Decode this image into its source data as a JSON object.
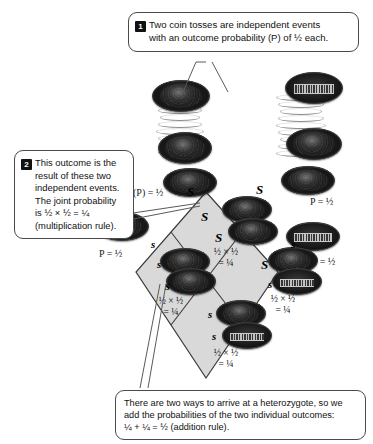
{
  "callouts": [
    {
      "id": "callout-1",
      "number": "1",
      "line1": "Two coin tosses are independent events",
      "line2": "with an outcome probability (P) of ½ each."
    },
    {
      "id": "callout-2",
      "number": "2",
      "line1": "This outcome is the",
      "line2": "result of these two",
      "line3": "independent events.",
      "line4": "The joint probability",
      "line5": "is ½ × ½ = ¼",
      "line6": "(multiplication rule)."
    },
    {
      "id": "callout-3",
      "line1": "There are two ways to arrive at a heterozygote, so we",
      "line2": "add the probabilities of the two individual outcomes:",
      "line3": "¼ + ¼ = ½  (addition rule)."
    }
  ],
  "probability_labels": [
    {
      "name": "p-label-top-left",
      "text": "(P) = ½"
    },
    {
      "name": "p-label-left",
      "text": "P = ½"
    },
    {
      "name": "p-label-top-right",
      "text": "P = ½"
    },
    {
      "name": "p-label-right",
      "text": "P = ½"
    }
  ],
  "alleles": {
    "top_left": "S",
    "top_right": "S",
    "left_upper": "S",
    "left_lower": "s",
    "inner_top_left": "S",
    "inner_top_right": "S",
    "inner_left_upper": "s",
    "inner_left_lower": "s",
    "inner_mid_left": "S",
    "inner_mid_right": "s",
    "inner_bottom_left": "s",
    "inner_bottom_right": "s",
    "left_outer": "s",
    "right_outer": "S",
    "bottom_left": "S",
    "bottom_right": "s"
  },
  "cells": [
    {
      "name": "cell-top",
      "genotype": "SS",
      "line1": "½ × ½",
      "line2": "= ¼"
    },
    {
      "name": "cell-left",
      "genotype": "Ss",
      "line1": "½ × ½",
      "line2": "= ¼"
    },
    {
      "name": "cell-right",
      "genotype": "Ss",
      "line1": "½ × ½",
      "line2": "= ¼"
    },
    {
      "name": "cell-bottom",
      "genotype": "ss",
      "line1": "½ × ½",
      "line2": "= ¼"
    }
  ],
  "colors": {
    "square_fill": "#d9d9d9",
    "square_stroke": "#3b3b3b",
    "callout_stroke": "#4a4a4a",
    "badge_bg": "#111111",
    "text": "#111111"
  },
  "coins": [
    {
      "name": "coin-toss-left-upper",
      "side": "heads"
    },
    {
      "name": "coin-toss-left-lower",
      "side": "heads"
    },
    {
      "name": "coin-toss-right-upper",
      "side": "tails"
    },
    {
      "name": "coin-toss-right-lower",
      "side": "heads"
    },
    {
      "name": "coin-parent-left",
      "side": "heads"
    },
    {
      "name": "coin-parent-right",
      "side": "heads"
    },
    {
      "name": "coin-outer-left",
      "side": "heads"
    },
    {
      "name": "coin-outer-right",
      "side": "tails"
    },
    {
      "name": "coin-cell-top-a",
      "side": "heads"
    },
    {
      "name": "coin-cell-top-b",
      "side": "heads"
    },
    {
      "name": "coin-cell-left-a",
      "side": "heads"
    },
    {
      "name": "coin-cell-left-b",
      "side": "heads"
    },
    {
      "name": "coin-cell-right-a",
      "side": "heads"
    },
    {
      "name": "coin-cell-right-b",
      "side": "tails"
    },
    {
      "name": "coin-cell-bottom-a",
      "side": "heads"
    },
    {
      "name": "coin-cell-bottom-b",
      "side": "tails"
    }
  ]
}
